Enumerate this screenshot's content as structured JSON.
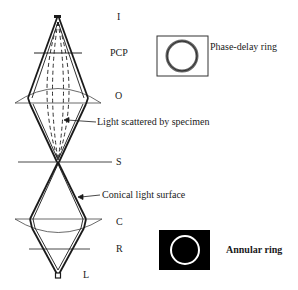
{
  "diagram": {
    "type": "phase-contrast-microscope-light-path",
    "planes": [
      {
        "id": "I",
        "label": "I",
        "y": 18
      },
      {
        "id": "PCP",
        "label": "PCP",
        "y": 53
      },
      {
        "id": "O",
        "label": "O",
        "y": 96
      },
      {
        "id": "S",
        "label": "S",
        "y": 162
      },
      {
        "id": "C",
        "label": "C",
        "y": 222
      },
      {
        "id": "R",
        "label": "R",
        "y": 250
      },
      {
        "id": "L",
        "label": "L",
        "y": 276
      }
    ],
    "annotations": {
      "light_scattered": "Light scattered by specimen",
      "conical_light": "Conical light surface",
      "phase_delay_ring": "Phase-delay ring",
      "annular_ring": "Annular ring"
    },
    "insets": {
      "phase_plate": {
        "label": "Phase-delay ring",
        "background": "#ffffff",
        "ring_color": "#555555"
      },
      "annulus": {
        "label": "Annular ring",
        "background": "#000000",
        "ring_color": "#ffffff"
      }
    },
    "colors": {
      "line": "#1a1a1a",
      "thin_line": "#444444"
    }
  }
}
